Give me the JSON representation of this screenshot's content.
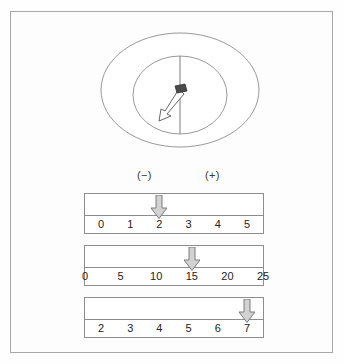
{
  "figure": {
    "title": "",
    "dial": {
      "name": "galvanometer-dial",
      "needle_direction": "down-left",
      "center_line": "vertical",
      "pivot": "dark-pivot-block"
    },
    "polarity": {
      "negative_label": "(−)",
      "positive_label": "(+)"
    },
    "scales": [
      {
        "id": "scale-1",
        "ticks": [
          "0",
          "1",
          "2",
          "3",
          "4",
          "5"
        ],
        "pointer_value": "2",
        "pointer_index": 2
      },
      {
        "id": "scale-2",
        "ticks": [
          "0",
          "5",
          "10",
          "15",
          "20",
          "25"
        ],
        "pointer_value": "15",
        "pointer_index": 3
      },
      {
        "id": "scale-3",
        "ticks": [
          "2",
          "3",
          "4",
          "5",
          "6",
          "7"
        ],
        "pointer_value": "7",
        "pointer_index": 5
      }
    ]
  },
  "colors": {
    "frame_border": "#a8a8a8",
    "line": "#8d8d8d",
    "arrow_fill": "#d2d2d2",
    "arrow_stroke": "#6f6f6f",
    "text": "#222222",
    "pivot": "#4a4a4a",
    "background": "#fdfdfd"
  },
  "chart_data": {
    "type": "table",
    "series": [
      {
        "name": "scale-1",
        "categories": [
          "0",
          "1",
          "2",
          "3",
          "4",
          "5"
        ],
        "pointer": "2"
      },
      {
        "name": "scale-2",
        "categories": [
          "0",
          "5",
          "10",
          "15",
          "20",
          "25"
        ],
        "pointer": "15"
      },
      {
        "name": "scale-3",
        "categories": [
          "2",
          "3",
          "4",
          "5",
          "6",
          "7"
        ],
        "pointer": "7"
      }
    ],
    "annotations": [
      "(−)",
      "(+)"
    ],
    "xlabel": "",
    "ylabel": "",
    "grid": false,
    "legend": "none"
  }
}
